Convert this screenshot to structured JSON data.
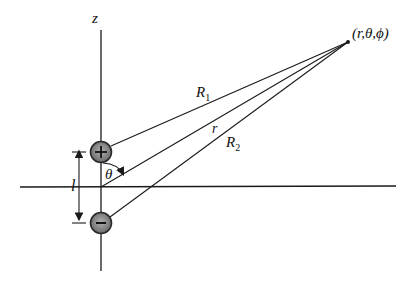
{
  "diagram": {
    "colors": {
      "line": "#1a1a1a",
      "charge_fill": "#8a8a8a",
      "charge_ring": "#2a2a2a",
      "background": "#ffffff"
    },
    "axes": {
      "z_label": "z"
    },
    "charges": [
      {
        "sign": "+",
        "symbol": "+",
        "position": "upper"
      },
      {
        "sign": "-",
        "symbol": "−",
        "position": "lower"
      }
    ],
    "labels": {
      "point": "(r,θ,ϕ)",
      "R1_main": "R",
      "R1_sub": "1",
      "r": "r",
      "R2_main": "R",
      "R2_sub": "2",
      "theta": "θ",
      "separation": "l"
    }
  }
}
